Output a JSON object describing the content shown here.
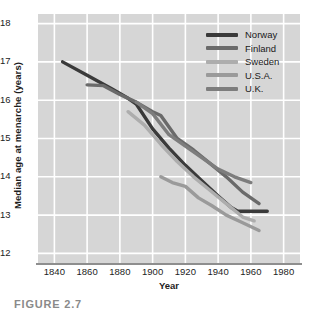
{
  "figure": {
    "caption": "FIGURE 2.7"
  },
  "chart_data": {
    "type": "line",
    "title": "",
    "xlabel": "Year",
    "ylabel": "Median age at menarche (years)",
    "xlim": [
      1830,
      1990
    ],
    "ylim": [
      11.75,
      18.25
    ],
    "grid": true,
    "legend_position": "top-right",
    "xticks": [
      1840,
      1860,
      1880,
      1900,
      1920,
      1940,
      1960,
      1980
    ],
    "yticks": [
      12,
      13,
      14,
      15,
      16,
      17,
      18
    ],
    "series": [
      {
        "name": "Norway",
        "color": "#3a3a3a",
        "x": [
          1845,
          1860,
          1875,
          1885,
          1890,
          1900,
          1910,
          1920,
          1930,
          1940,
          1948,
          1952,
          1970
        ],
        "y": [
          17.0,
          16.65,
          16.3,
          16.05,
          15.9,
          15.25,
          14.75,
          14.3,
          13.9,
          13.5,
          13.2,
          13.1,
          13.1
        ]
      },
      {
        "name": "Finland",
        "color": "#6a6a6a",
        "x": [
          1860,
          1870,
          1880,
          1890,
          1900,
          1905,
          1915,
          1925,
          1935,
          1945,
          1955,
          1965
        ],
        "y": [
          16.4,
          16.38,
          16.15,
          15.95,
          15.7,
          15.6,
          15.0,
          14.7,
          14.35,
          14.0,
          13.6,
          13.3
        ]
      },
      {
        "name": "Sweden",
        "color": "#adadad",
        "x": [
          1885,
          1895,
          1905,
          1915,
          1925,
          1935,
          1945,
          1955,
          1962
        ],
        "y": [
          15.7,
          15.35,
          14.85,
          14.4,
          14.0,
          13.65,
          13.3,
          12.95,
          12.85
        ]
      },
      {
        "name": "U.S.A.",
        "color": "#9a9a9a",
        "x": [
          1905,
          1912,
          1920,
          1928,
          1936,
          1945,
          1955,
          1965
        ],
        "y": [
          14.0,
          13.85,
          13.75,
          13.45,
          13.25,
          13.0,
          12.8,
          12.6
        ]
      },
      {
        "name": "U.K.",
        "color": "#7d7d7d",
        "x": [
          1890,
          1900,
          1910,
          1920,
          1930,
          1940,
          1950,
          1960
        ],
        "y": [
          15.95,
          15.65,
          15.1,
          14.8,
          14.5,
          14.2,
          14.0,
          13.85
        ]
      }
    ]
  },
  "legend": {
    "entries": [
      {
        "label": "Norway",
        "color": "#3a3a3a"
      },
      {
        "label": "Finland",
        "color": "#6a6a6a"
      },
      {
        "label": "Sweden",
        "color": "#adadad"
      },
      {
        "label": "U.S.A.",
        "color": "#9a9a9a"
      },
      {
        "label": "U.K.",
        "color": "#7d7d7d"
      }
    ]
  }
}
